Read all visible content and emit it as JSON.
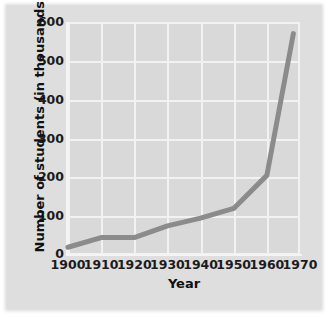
{
  "chart_data": {
    "type": "line",
    "title": "",
    "xlabel": "Year",
    "ylabel": "Number of students (in thousands)",
    "xlim": [
      1900,
      1970
    ],
    "ylim": [
      0,
      600
    ],
    "grid": true,
    "legend": "none",
    "xticks": [
      "1900",
      "1910",
      "1920",
      "1930",
      "1940",
      "1950",
      "1960",
      "1970"
    ],
    "yticks": [
      "0",
      "100",
      "200",
      "300",
      "400",
      "500",
      "600"
    ],
    "x": [
      1900,
      1910,
      1920,
      1930,
      1940,
      1950,
      1960,
      1968
    ],
    "values": [
      20,
      45,
      45,
      75,
      95,
      120,
      205,
      570
    ],
    "series": [
      {
        "name": "Number of students",
        "x": [
          1900,
          1910,
          1920,
          1930,
          1940,
          1950,
          1960,
          1968
        ],
        "values": [
          20,
          45,
          45,
          75,
          95,
          120,
          205,
          570
        ]
      }
    ],
    "colors": {
      "line": "#8b8b8b",
      "plot_background": "#d9d9d9",
      "gridline": "#f2f2f2",
      "figure_background": "#dedede",
      "text": "#1b1b1b"
    },
    "line_width": 5
  }
}
